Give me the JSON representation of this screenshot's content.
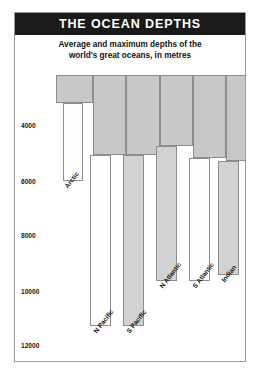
{
  "header": {
    "title": "THE OCEAN DEPTHS",
    "subtitle_line1": "Average and maximum depths of the",
    "subtitle_line2": "world's great oceans, in metres"
  },
  "chart_data": {
    "type": "bar",
    "title": "THE OCEAN DEPTHS",
    "subtitle": "Average and maximum depths of the world's great oceans, in metres",
    "xlabel": "",
    "ylabel": "",
    "ylim": [
      0,
      13000
    ],
    "y_axis_direction": "inverted",
    "grid": false,
    "legend": "none",
    "tick_labels": [
      "4000",
      "6000",
      "8000",
      "10000",
      "12000"
    ],
    "tick_values": [
      4000,
      6000,
      8000,
      10000,
      12000
    ],
    "categories": [
      "Arctic",
      "N Pacific",
      "S Pacific",
      "N Atlantic",
      "S Atlantic",
      "Indian"
    ],
    "series": [
      {
        "name": "Average depth",
        "values": [
          1300,
          4000,
          4000,
          3600,
          4100,
          4300
        ]
      },
      {
        "name": "Maximum depth",
        "values": [
          5500,
          10900,
          10900,
          9200,
          9200,
          8900
        ]
      }
    ]
  },
  "bars": [
    {
      "name": "Arctic",
      "label": "Arctic",
      "avg_left": 41,
      "avg_width": 37,
      "avg_bottom": 90,
      "max_left": 48,
      "max_width": 20,
      "max_bottom": 168,
      "max_shaded": false,
      "label_x": 48,
      "label_y": 172
    },
    {
      "name": "N Pacific",
      "label": "N Pacific",
      "avg_left": 78,
      "avg_width": 33,
      "avg_bottom": 142,
      "max_left": 75,
      "max_width": 21,
      "max_bottom": 313,
      "max_shaded": false,
      "label_x": 77,
      "label_y": 317
    },
    {
      "name": "S Pacific",
      "label": "S Pacific",
      "avg_left": 111,
      "avg_width": 34,
      "avg_bottom": 142,
      "max_left": 108,
      "max_width": 21,
      "max_bottom": 313,
      "max_shaded": true,
      "label_x": 110,
      "label_y": 317
    },
    {
      "name": "N Atlantic",
      "label": "N Atlantic",
      "avg_left": 145,
      "avg_width": 33,
      "avg_bottom": 133,
      "max_left": 141,
      "max_width": 21,
      "max_bottom": 268,
      "max_shaded": true,
      "label_x": 143,
      "label_y": 272
    },
    {
      "name": "S Atlantic",
      "label": "S Atlantic",
      "avg_left": 178,
      "avg_width": 33,
      "avg_bottom": 145,
      "max_left": 174,
      "max_width": 21,
      "max_bottom": 268,
      "max_shaded": false,
      "label_x": 176,
      "label_y": 272
    },
    {
      "name": "Indian",
      "label": "Indian",
      "avg_left": 211,
      "avg_width": 36,
      "avg_bottom": 148,
      "max_left": 203,
      "max_width": 21,
      "max_bottom": 262,
      "max_shaded": true,
      "label_x": 205,
      "label_y": 266
    }
  ],
  "yticks": [
    {
      "label": "4000",
      "y": 112
    },
    {
      "label": "6000",
      "y": 168
    },
    {
      "label": "8000",
      "y": 222
    },
    {
      "label": "10000",
      "y": 278
    },
    {
      "label": "12000",
      "y": 332
    }
  ]
}
